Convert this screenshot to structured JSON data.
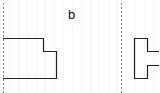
{
  "diagram": {
    "label": "b",
    "colors": {
      "stroke": "#222222",
      "axis": "#888888",
      "background": "#ffffff"
    },
    "views": [
      {
        "name": "front-view",
        "axis_x": 3
      },
      {
        "name": "side-view",
        "axis_x": 121
      }
    ]
  }
}
